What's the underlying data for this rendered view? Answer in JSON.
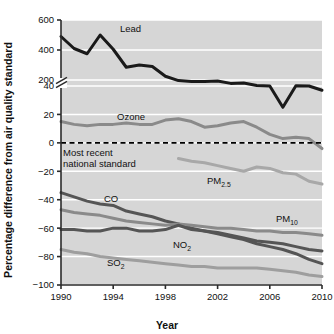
{
  "figure": {
    "background": "#ffffff",
    "plot_background": "#d6d6d6",
    "gridline_color": "#ffffff",
    "axis_color": "#2b2b2b"
  },
  "chart_data": {
    "type": "line",
    "title": "",
    "xlabel": "Year",
    "ylabel": "Percentage difference from air quality standard",
    "xlim": [
      1990,
      2010
    ],
    "xticks": [
      1990,
      1994,
      1998,
      2002,
      2006,
      2010
    ],
    "xtick_labels": [
      "1990",
      "1994",
      "1998",
      "2002",
      "2006",
      "2010"
    ],
    "yticks": [
      600,
      400,
      200,
      40,
      20,
      0,
      -20,
      -40,
      -60,
      -80,
      -100
    ],
    "ytick_labels": [
      "600",
      "400",
      "200",
      "40",
      "20",
      "0",
      "−20",
      "−40",
      "−60",
      "−80",
      "−100"
    ],
    "axis_break": {
      "present": true,
      "between": [
        200,
        40
      ],
      "symbol": "//"
    },
    "grid": "horizontal",
    "legend": "inline-labels",
    "zero_reference": {
      "value": 0,
      "style": "dashed",
      "color": "#000000",
      "label": "Most recent national standard"
    },
    "x": [
      1990,
      1991,
      1992,
      1993,
      1994,
      1995,
      1996,
      1997,
      1998,
      1999,
      2000,
      2001,
      2002,
      2003,
      2004,
      2005,
      2006,
      2007,
      2008,
      2009,
      2010
    ],
    "series": [
      {
        "name": "Lead",
        "label": "Lead",
        "color": "#1a1a1a",
        "width": 3.0,
        "values": [
          490,
          410,
          375,
          500,
          405,
          285,
          300,
          290,
          225,
          185,
          160,
          163,
          175,
          110,
          118,
          55,
          40,
          25,
          47,
          40,
          37
        ],
        "note": "values above axis break are on the 0-600 upper scale; below 40 they use the expanded lower scale"
      },
      {
        "name": "Ozone",
        "label": "Ozone",
        "color": "#8a8a8a",
        "width": 3.0,
        "values": [
          15,
          13,
          12,
          13,
          13,
          14,
          13,
          13,
          16,
          17,
          15,
          11,
          12,
          14,
          15,
          11,
          6,
          3,
          4,
          3,
          -4
        ]
      },
      {
        "name": "PM2.5",
        "label": "PM",
        "label_sub": "2.5",
        "color": "#a8a8a8",
        "width": 3.0,
        "start_year": 1999,
        "values": [
          null,
          null,
          null,
          null,
          null,
          null,
          null,
          null,
          null,
          -11,
          -13,
          -14,
          -16,
          -18,
          -20,
          -17,
          -18,
          -21,
          -22,
          -27,
          -29
        ]
      },
      {
        "name": "CO",
        "label": "CO",
        "color": "#555555",
        "width": 3.0,
        "values": [
          -35,
          -38,
          -41,
          -43,
          -44,
          -48,
          -50,
          -52,
          -55,
          -57,
          -60,
          -62,
          -64,
          -66,
          -68,
          -71,
          -73,
          -75,
          -78,
          -82,
          -85
        ]
      },
      {
        "name": "PM10",
        "label": "PM",
        "label_sub": "10",
        "color": "#8a8a8a",
        "width": 3.0,
        "values": [
          -47,
          -49,
          -50,
          -51,
          -53,
          -55,
          -56,
          -57,
          -58,
          -57,
          -58,
          -59,
          -60,
          -60,
          -61,
          -62,
          -62,
          -63,
          -63,
          -64,
          -65
        ]
      },
      {
        "name": "NO2",
        "label": "NO",
        "label_sub": "2",
        "color": "#555555",
        "width": 3.0,
        "values": [
          -61,
          -61,
          -62,
          -62,
          -60,
          -60,
          -62,
          -62,
          -61,
          -58,
          -61,
          -62,
          -63,
          -65,
          -67,
          -69,
          -70,
          -71,
          -73,
          -75,
          -76
        ]
      },
      {
        "name": "SO2",
        "label": "SO",
        "label_sub": "2",
        "color": "#9e9e9e",
        "width": 3.0,
        "values": [
          -75,
          -77,
          -78,
          -80,
          -81,
          -82,
          -83,
          -84,
          -85,
          -86,
          -87,
          -87,
          -88,
          -88,
          -88,
          -88,
          -89,
          -90,
          -91,
          -93,
          -94
        ]
      }
    ],
    "series_label_positions": [
      {
        "name": "Lead",
        "x": 120,
        "y": 32
      },
      {
        "name": "Ozone",
        "x": 117,
        "y": 120
      },
      {
        "name": "PM2.5",
        "x": 207,
        "y": 184
      },
      {
        "name": "CO",
        "x": 104,
        "y": 202
      },
      {
        "name": "PM10",
        "x": 276,
        "y": 222
      },
      {
        "name": "NO2",
        "x": 173,
        "y": 248
      },
      {
        "name": "SO2",
        "x": 107,
        "y": 266
      }
    ],
    "annotation_lines": [
      "Most recent",
      "national standard"
    ]
  }
}
